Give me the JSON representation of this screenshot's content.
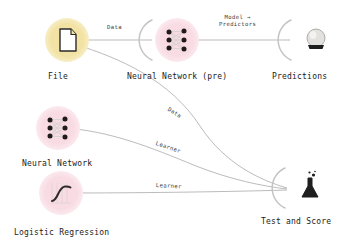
{
  "app": {
    "kind": "workflow-canvas",
    "background": "#ffffff"
  },
  "colors": {
    "data_halo": "#f2e3a4",
    "model_halo": "#f8dbe3",
    "link": "#b0b0b0",
    "arc": "#c9c9c9",
    "label_text": "#1a1a1a",
    "link_text": "#3a3a3a"
  },
  "widgets": [
    {
      "id": "file",
      "label": "File",
      "icon": "file-document-icon",
      "halo": "yellow",
      "x": 45,
      "y": 18,
      "label_x": 48,
      "label_y": 72
    },
    {
      "id": "neural-network-pre",
      "label": "Neural Network (pre)",
      "icon": "neural-network-icon",
      "halo": "pink",
      "x": 155,
      "y": 18,
      "label_x": 127,
      "label_y": 72
    },
    {
      "id": "predictions",
      "label": "Predictions",
      "icon": "crystal-ball-icon",
      "halo": "none",
      "x": 294,
      "y": 18,
      "label_x": 272,
      "label_y": 72
    },
    {
      "id": "neural-network",
      "label": "Neural Network",
      "icon": "neural-network-icon",
      "halo": "pink",
      "x": 36,
      "y": 106,
      "label_x": 22,
      "label_y": 159
    },
    {
      "id": "logistic-regression",
      "label": "Logistic Regression",
      "icon": "sigmoid-curve-icon",
      "halo": "pink",
      "x": 39,
      "y": 171,
      "label_x": 14,
      "label_y": 228
    },
    {
      "id": "test-and-score",
      "label": "Test and Score",
      "icon": "flask-icon",
      "halo": "none",
      "x": 288,
      "y": 166,
      "label_x": 261,
      "label_y": 217
    }
  ],
  "links": [
    {
      "id": "file-to-neural-network-pre",
      "label": "Data",
      "from": "file",
      "to": "neural-network-pre",
      "label_x": 107,
      "label_y": 24,
      "rotation": 0
    },
    {
      "id": "neural-network-pre-to-predictions",
      "label": "Model →\nPredictors",
      "label_line1": "Model →",
      "label_line2": "Predictors",
      "from": "neural-network-pre",
      "to": "predictions",
      "label_x": 219,
      "label_y": 15,
      "rotation": 0
    },
    {
      "id": "file-to-test-and-score",
      "label": "Data",
      "from": "file",
      "to": "test-and-score",
      "label_x": 170,
      "label_y": 106,
      "rotation": 33
    },
    {
      "id": "neural-network-to-test-and-score",
      "label": "Learner",
      "from": "neural-network",
      "to": "test-and-score",
      "label_x": 157,
      "label_y": 140,
      "rotation": 19
    },
    {
      "id": "logistic-regression-to-test-and-score",
      "label": "Learner",
      "from": "logistic-regression",
      "to": "test-and-score",
      "label_x": 156,
      "label_y": 182,
      "rotation": 3
    }
  ]
}
